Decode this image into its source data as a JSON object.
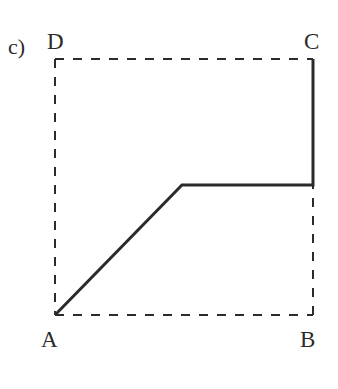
{
  "figure": {
    "panel_label": "c)",
    "background_color": "#ffffff",
    "stroke_color": "#2b2b2b",
    "width": 338,
    "height": 389
  },
  "labels": {
    "panel": "c)",
    "vertex_a": "A",
    "vertex_b": "B",
    "vertex_c": "C",
    "vertex_d": "D"
  },
  "chart_data": {
    "type": "line",
    "title": "c)",
    "xlabel": "",
    "ylabel": "",
    "grid": false,
    "legend": null,
    "annotations": [
      {
        "text": "c)",
        "x": 8,
        "y": 47,
        "role": "panel-label"
      },
      {
        "text": "D",
        "x": 55,
        "y": 41,
        "role": "vertex-label"
      },
      {
        "text": "C",
        "x": 313,
        "y": 41,
        "role": "vertex-label"
      },
      {
        "text": "A",
        "x": 50,
        "y": 339,
        "role": "vertex-label"
      },
      {
        "text": "B",
        "x": 309,
        "y": 339,
        "role": "vertex-label"
      }
    ],
    "vertices": {
      "A": {
        "x": 55,
        "y": 315
      },
      "B": {
        "x": 313,
        "y": 315
      },
      "C": {
        "x": 313,
        "y": 59
      },
      "D": {
        "x": 55,
        "y": 59
      }
    },
    "series": [
      {
        "name": "bounding-box-dashed",
        "style": "dashed",
        "stroke_width": 2,
        "points": [
          {
            "x": 55,
            "y": 315
          },
          {
            "x": 55,
            "y": 59
          },
          {
            "x": 313,
            "y": 59
          },
          {
            "x": 313,
            "y": 315
          },
          {
            "x": 55,
            "y": 315
          }
        ]
      },
      {
        "name": "solid-path",
        "style": "solid",
        "stroke_width": 3,
        "points": [
          {
            "x": 55,
            "y": 315
          },
          {
            "x": 182,
            "y": 185
          },
          {
            "x": 313,
            "y": 185
          },
          {
            "x": 313,
            "y": 59
          }
        ]
      }
    ]
  }
}
